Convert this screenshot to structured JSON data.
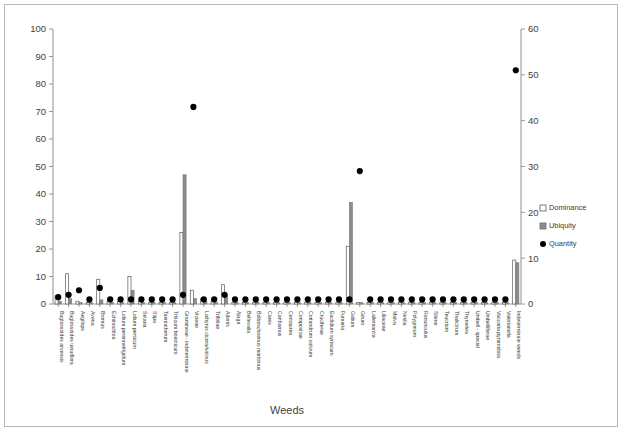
{
  "chart_data": {
    "type": "bar",
    "title": "",
    "xlabel": "Weeds",
    "ylabel": "",
    "ylim": [
      0,
      100
    ],
    "y2lim": [
      0,
      60
    ],
    "grid": false,
    "legend_position": "right",
    "yticks": [
      "0",
      "10",
      "20",
      "30",
      "40",
      "50",
      "60",
      "70",
      "80",
      "90",
      "100"
    ],
    "y2ticks": [
      "0",
      "10",
      "20",
      "30",
      "40",
      "50",
      "60"
    ],
    "categories": [
      "Buglossoides arvensis",
      "Buglossoides tenuiflora",
      "Aegilops",
      "Avena",
      "Bromus",
      "Echinochloa",
      "Lolium perenne/rigidum",
      "Lolium persicum",
      "Setaria",
      "Stipa",
      "Taeniatherum",
      "Triticum boeoticum",
      "Gramineae - indeterminate",
      "Vicieae",
      "Lathyrus cicera/sativus",
      "Trifoliae",
      "Adonis",
      "Ajuga",
      "Bellevalia",
      "Bolboschoenus maritimus",
      "Carex",
      "Carthamus",
      "Centaurea",
      "Compositae",
      "Coriandrum sativum",
      "Cruciferae",
      "Euclidium syriacum",
      "Fumaria",
      "Galium",
      "Geum",
      "Lallemantia",
      "Liliaceae",
      "Malva",
      "Neslia",
      "Polygonum",
      "Ranunculus",
      "Silene",
      "Teucrium",
      "Thalictrum",
      "Thymelea",
      "Umbell - special",
      "Umbelliferae",
      "Vaccaria pyramidata",
      "Valerianella",
      "Indeterminate weeds"
    ],
    "series": [
      {
        "name": "Dominance",
        "axis": "left",
        "values": [
          3,
          11,
          1,
          0.5,
          9,
          1,
          1,
          10,
          1,
          0.5,
          0.5,
          0.5,
          26,
          5,
          2,
          1,
          7,
          0.5,
          0.5,
          0.5,
          0.5,
          0.5,
          0.5,
          0.5,
          0.5,
          0.5,
          0.5,
          0.5,
          21,
          0.5,
          0.5,
          0.5,
          0.5,
          0.5,
          0.5,
          0.5,
          0.5,
          0.5,
          0.5,
          0.5,
          0.5,
          0.5,
          0.5,
          0.5,
          16
        ]
      },
      {
        "name": "Ubiquity",
        "axis": "left",
        "values": [
          1,
          2,
          0.5,
          0.5,
          1.5,
          0.5,
          0.5,
          5,
          0.5,
          0.5,
          0.5,
          0.5,
          47,
          2,
          1,
          0.5,
          3,
          0.5,
          0.5,
          0.5,
          0.5,
          0.5,
          0.5,
          0.5,
          0.5,
          0.5,
          0.5,
          0.5,
          37,
          0.5,
          0.5,
          0.5,
          0.5,
          0.5,
          0.5,
          0.5,
          0.5,
          0.5,
          0.5,
          0.5,
          0.5,
          0.5,
          0.5,
          0.5,
          15
        ]
      },
      {
        "name": "Quantity",
        "axis": "right",
        "values": [
          1.5,
          2,
          3,
          1,
          3.5,
          1,
          1,
          1,
          1,
          1,
          1,
          1,
          2,
          43,
          1,
          1,
          2,
          1,
          1,
          1,
          1,
          1,
          1,
          1,
          1,
          1,
          1,
          1,
          1,
          29,
          1,
          1,
          1,
          1,
          1,
          1,
          1,
          1,
          1,
          1,
          1,
          1,
          1,
          1,
          51
        ]
      }
    ],
    "legend": [
      {
        "label": "Dominance",
        "marker": "open-square"
      },
      {
        "label": "Ubiquity",
        "marker": "gray-square"
      },
      {
        "label": "Quantity",
        "marker": "black-dot"
      }
    ],
    "colors": {
      "dominance_fill": "#ffffff",
      "dominance_stroke": "#5a5a5a",
      "ubiquity_fill": "#8c8c8c",
      "quantity_fill": "#000000",
      "axis": "#9a9a9a",
      "text": "#3f3f3f"
    }
  }
}
